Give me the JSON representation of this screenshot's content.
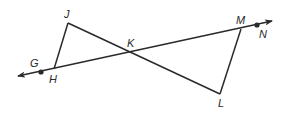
{
  "diagram": {
    "type": "geometry",
    "colors": {
      "stroke": "#2a2a2a",
      "background": "#ffffff"
    },
    "points": {
      "J": {
        "label": "J",
        "x": 68,
        "y": 23,
        "label_x": 64,
        "label_y": 18
      },
      "G": {
        "label": "G",
        "x": 41,
        "y": 72,
        "label_x": 30,
        "label_y": 67
      },
      "H": {
        "label": "H",
        "x": 54,
        "y": 69,
        "label_x": 49,
        "label_y": 83
      },
      "K": {
        "label": "K",
        "x": 131,
        "y": 53,
        "label_x": 127,
        "label_y": 47
      },
      "M": {
        "label": "M",
        "x": 241,
        "y": 29,
        "label_x": 236,
        "label_y": 24
      },
      "N": {
        "label": "N",
        "x": 257,
        "y": 25,
        "label_x": 259,
        "label_y": 38
      },
      "L": {
        "label": "L",
        "x": 220,
        "y": 94,
        "label_x": 218,
        "label_y": 107
      }
    },
    "line": {
      "name": "line-GN",
      "from": [
        18,
        76
      ],
      "to": [
        272,
        21
      ],
      "arrows": "both"
    },
    "segments": [
      {
        "name": "segment-HJ",
        "from": "H",
        "to": "J"
      },
      {
        "name": "segment-JL",
        "from": "J",
        "to": "L"
      },
      {
        "name": "segment-LM",
        "from": "L",
        "to": "M"
      }
    ],
    "dots": [
      "G",
      "N"
    ]
  }
}
